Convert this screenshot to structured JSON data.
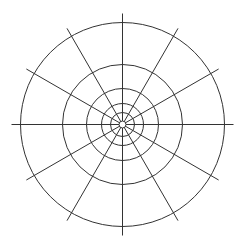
{
  "diagram": {
    "type": "polar-grid",
    "background": "#ffffff",
    "stroke_color": "#333333",
    "center": {
      "x": 122.5,
      "y": 124.5
    },
    "ring_radii": [
      3.5,
      12,
      21,
      36,
      60,
      102
    ],
    "spoke_count": 12,
    "spoke_angle_step_deg": 30,
    "spoke_inner_radius": 3.5,
    "spoke_outer_radius": 111
  }
}
